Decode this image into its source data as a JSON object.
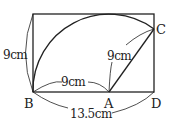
{
  "diagram": {
    "points": {
      "B": "B",
      "A": "A",
      "D": "D",
      "C": "C"
    },
    "measurements": {
      "left_side": "9cm",
      "BA": "9cm",
      "AC": "9cm",
      "BD": "13.5cm"
    },
    "colors": {
      "stroke": "#222222",
      "background": "#ffffff"
    }
  }
}
